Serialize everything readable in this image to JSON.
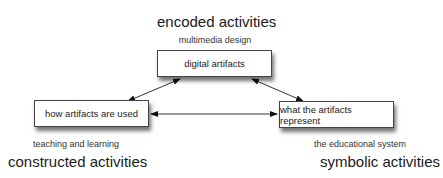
{
  "diagram": {
    "top": {
      "heading": "encoded activities",
      "subheading": "multimedia design",
      "box": "digital artifacts"
    },
    "left": {
      "box": "how artifacts are used",
      "subheading": "teaching and learning",
      "heading": "constructed activities"
    },
    "right": {
      "box": "what the artifacts represent",
      "subheading": "the educational system",
      "heading": "symbolic activities"
    },
    "connections": [
      {
        "from": "digital artifacts",
        "to": "how artifacts are used",
        "direction": "bidirectional"
      },
      {
        "from": "digital artifacts",
        "to": "what the artifacts represent",
        "direction": "bidirectional"
      },
      {
        "from": "how artifacts are used",
        "to": "what the artifacts represent",
        "direction": "bidirectional"
      }
    ]
  }
}
